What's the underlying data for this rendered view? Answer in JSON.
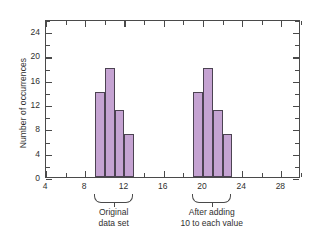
{
  "chart_data": {
    "type": "bar",
    "title": "",
    "xlabel": "",
    "ylabel": "Number of occurrences",
    "xlim": [
      4,
      30
    ],
    "ylim": [
      0,
      26
    ],
    "grid": false,
    "legend": null,
    "y_ticks": [
      0,
      4,
      8,
      12,
      16,
      20,
      24
    ],
    "x_ticks": [
      4,
      8,
      12,
      16,
      20,
      24,
      28
    ],
    "x_minor_tick_step": 2,
    "y_minor_tick_step": 2,
    "bar_color": "#c5a3d2",
    "bar_edge_color": "#4c4352",
    "axis_color": "#4a4a4a",
    "series": [
      {
        "name": "Original data set",
        "bin_edges": [
          9,
          10,
          11,
          12,
          13
        ],
        "bin_centers": [
          9.5,
          10.5,
          11.5,
          12.5
        ],
        "values": [
          14,
          18,
          11,
          7
        ]
      },
      {
        "name": "After adding 10 to each value",
        "bin_edges": [
          19,
          20,
          21,
          22,
          23
        ],
        "bin_centers": [
          19.5,
          20.5,
          21.5,
          22.5
        ],
        "values": [
          14,
          18,
          11,
          7
        ]
      }
    ],
    "annotations": [
      {
        "text": "Original data set",
        "line1": "Original",
        "line2": "data set",
        "brace_span": [
          9,
          13
        ]
      },
      {
        "text": "After adding 10 to each value",
        "line1": "After adding",
        "line2": "10 to each value",
        "brace_span": [
          19,
          23
        ]
      }
    ]
  },
  "axis": {
    "y_title": "Number of occurrences",
    "y_tick_labels": [
      "0",
      "4",
      "8",
      "12",
      "16",
      "20",
      "24"
    ],
    "x_tick_labels": [
      "4",
      "8",
      "12",
      "16",
      "20",
      "24",
      "28"
    ]
  },
  "groups": [
    {
      "line1": "Original",
      "line2": "data set"
    },
    {
      "line1": "After adding",
      "line2": "10 to each value"
    }
  ],
  "footer": {
    "cut_text": ""
  }
}
